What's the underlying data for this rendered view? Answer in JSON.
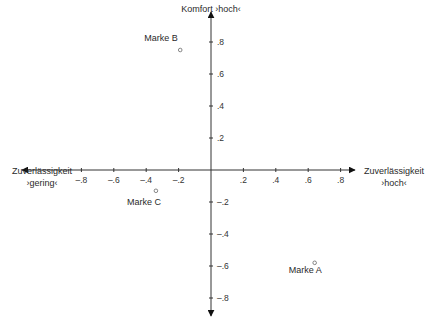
{
  "chart_data": {
    "type": "scatter",
    "title": "",
    "xlabel_left": [
      "Zuverlässigkeit",
      "›gering‹"
    ],
    "xlabel_right": [
      "Zuverlässigkeit",
      "›hoch‹"
    ],
    "ylabel_top": "Komfort ›hoch‹",
    "xlim": [
      -1,
      1
    ],
    "ylim": [
      -1,
      1
    ],
    "x_ticks": [
      {
        "value": -0.8,
        "label": "–.8"
      },
      {
        "value": -0.6,
        "label": "–.6"
      },
      {
        "value": -0.4,
        "label": "–.4"
      },
      {
        "value": -0.2,
        "label": "–.2"
      },
      {
        "value": 0.2,
        "label": ".2"
      },
      {
        "value": 0.4,
        "label": ".4"
      },
      {
        "value": 0.6,
        "label": ".6"
      },
      {
        "value": 0.8,
        "label": ".8"
      }
    ],
    "y_ticks": [
      {
        "value": 0.8,
        "label": ".8"
      },
      {
        "value": 0.6,
        "label": ".6"
      },
      {
        "value": 0.4,
        "label": ".4"
      },
      {
        "value": 0.2,
        "label": ".2"
      },
      {
        "value": -0.2,
        "label": "–.2"
      },
      {
        "value": -0.4,
        "label": "–.4"
      },
      {
        "value": -0.6,
        "label": "–.6"
      },
      {
        "value": -0.8,
        "label": "–.8"
      }
    ],
    "grid": false,
    "legend": null,
    "points": [
      {
        "name": "Marke A",
        "x": 0.64,
        "y": -0.58,
        "label_dx": -26,
        "label_dy": 10
      },
      {
        "name": "Marke B",
        "x": -0.19,
        "y": 0.75,
        "label_dx": -36,
        "label_dy": -9
      },
      {
        "name": "Marke C",
        "x": -0.34,
        "y": -0.13,
        "label_dx": -29,
        "label_dy": 14
      }
    ]
  }
}
